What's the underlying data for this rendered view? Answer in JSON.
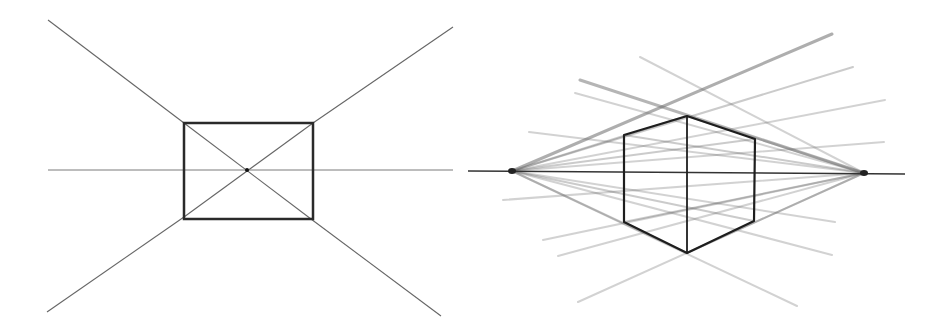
{
  "figure": {
    "panels": [
      {
        "id": "one-point-perspective",
        "caption": "",
        "horizon": {
          "x1": 48,
          "y1": 170,
          "x2": 453,
          "y2": 170,
          "color": "#7a7a7a",
          "width": 1
        },
        "vanishing_point": {
          "x": 247,
          "y": 170
        },
        "rectangle": {
          "x1": 184,
          "y1": 123,
          "x2": 313,
          "y2": 219,
          "color": "#2a2a2a",
          "width": 2.5
        },
        "orthogonals": [
          {
            "x1": 48,
            "y1": 20,
            "x2": 184,
            "y2": 123
          },
          {
            "x1": 453,
            "y1": 27,
            "x2": 313,
            "y2": 123
          },
          {
            "x1": 47,
            "y1": 312,
            "x2": 184,
            "y2": 217
          },
          {
            "x1": 441,
            "y1": 316,
            "x2": 311,
            "y2": 219
          }
        ],
        "diagonals": [
          {
            "x1": 184,
            "y1": 123,
            "x2": 311,
            "y2": 219
          },
          {
            "x1": 313,
            "y1": 123,
            "x2": 184,
            "y2": 217
          }
        ],
        "line_color": "#666666"
      },
      {
        "id": "two-point-perspective",
        "caption": "",
        "horizon": {
          "x1": 468,
          "y1": 171,
          "x2": 905,
          "y2": 174,
          "color": "#333333",
          "width": 1.6
        },
        "vanishing_points": [
          {
            "id": "vp-left",
            "x": 512,
            "y": 171
          },
          {
            "id": "vp-right",
            "x": 864,
            "y": 173
          }
        ],
        "box": {
          "vertical_edge": {
            "x1": 687,
            "y1": 116,
            "x2": 687,
            "y2": 253
          },
          "outline": [
            [
              624,
              135
            ],
            [
              687,
              116
            ],
            [
              755,
              139
            ],
            [
              754,
              221
            ],
            [
              687,
              253
            ],
            [
              624,
              222
            ]
          ],
          "color": "#1e1e1e",
          "width": 2.2
        },
        "rays_from_left_vp": [
          {
            "x2": 832,
            "y2": 34,
            "opacity": 0.55,
            "width": 3
          },
          {
            "x2": 853,
            "y2": 67,
            "opacity": 0.35,
            "width": 2
          },
          {
            "x2": 885,
            "y2": 100,
            "opacity": 0.3,
            "width": 2
          },
          {
            "x2": 884,
            "y2": 142,
            "opacity": 0.3,
            "width": 2
          },
          {
            "x2": 755,
            "y2": 139,
            "opacity": 0.35,
            "width": 2
          },
          {
            "x2": 754,
            "y2": 221,
            "opacity": 0.35,
            "width": 2
          },
          {
            "x2": 835,
            "y2": 222,
            "opacity": 0.3,
            "width": 2
          },
          {
            "x2": 832,
            "y2": 255,
            "opacity": 0.3,
            "width": 2
          },
          {
            "x2": 797,
            "y2": 306,
            "opacity": 0.3,
            "width": 2
          },
          {
            "x2": 687,
            "y2": 116,
            "opacity": 0.35,
            "width": 2
          },
          {
            "x2": 687,
            "y2": 253,
            "opacity": 0.35,
            "width": 2
          }
        ],
        "rays_from_right_vp": [
          {
            "x1": 580,
            "y1": 80,
            "opacity": 0.5,
            "width": 3
          },
          {
            "x1": 575,
            "y1": 93,
            "opacity": 0.3,
            "width": 2
          },
          {
            "x1": 640,
            "y1": 57,
            "opacity": 0.3,
            "width": 2
          },
          {
            "x1": 529,
            "y1": 132,
            "opacity": 0.3,
            "width": 2
          },
          {
            "x1": 503,
            "y1": 200,
            "opacity": 0.3,
            "width": 2
          },
          {
            "x1": 543,
            "y1": 240,
            "opacity": 0.3,
            "width": 2
          },
          {
            "x1": 558,
            "y1": 256,
            "opacity": 0.3,
            "width": 2
          },
          {
            "x1": 578,
            "y1": 302,
            "opacity": 0.3,
            "width": 2
          },
          {
            "x1": 624,
            "y1": 135,
            "opacity": 0.35,
            "width": 2
          },
          {
            "x1": 624,
            "y1": 222,
            "opacity": 0.35,
            "width": 2
          },
          {
            "x1": 687,
            "y1": 116,
            "opacity": 0.35,
            "width": 2
          },
          {
            "x1": 687,
            "y1": 253,
            "opacity": 0.35,
            "width": 2
          }
        ],
        "ray_color": "#6b6b6b"
      }
    ]
  }
}
